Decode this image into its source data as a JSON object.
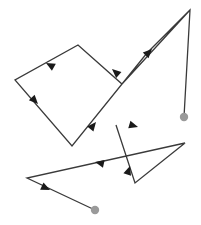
{
  "figure": {
    "type": "directed-polyline-diagram",
    "width": 201,
    "height": 225,
    "background_color": "#ffffff",
    "line_color": "#3a3a3a",
    "line_width": 1.3,
    "arrow_color": "#1a1a1a",
    "endpoint_dot_color": "#9a9a9a",
    "endpoint_dot_radius": 4.2,
    "arrow_length": 9,
    "arrow_half_width": 4,
    "title": "",
    "paths": [
      {
        "name": "path-a",
        "description": "Long zigzag path starting at top-right apex, sweeping left through an upper quadrilateral loop and down to the lower-left gray endpoint dot",
        "points": [
          [
            190,
            10
          ],
          [
            122,
            84
          ],
          [
            78,
            45
          ],
          [
            15,
            80
          ],
          [
            72,
            146
          ],
          [
            147,
            53
          ],
          [
            190,
            10
          ],
          [
            184,
            117
          ]
        ],
        "arrows": [
          {
            "at": [
              152,
              49
            ],
            "angle": -45
          },
          {
            "at": [
              112,
              69
            ],
            "angle": 221
          },
          {
            "at": [
              46,
              63
            ],
            "angle": 209
          },
          {
            "at": [
              38,
              104
            ],
            "angle": 46
          },
          {
            "at": [
              96,
              122
            ],
            "angle": -51
          }
        ],
        "start_dot": false,
        "end_dot": true,
        "end_dot_at": [
          184,
          117
        ]
      },
      {
        "name": "path-b",
        "description": "Lower zigzag path forming a narrow triangle on the right, crossing left to a shallow V and ending at the bottom gray dot",
        "points": [
          [
            116,
            125
          ],
          [
            135,
            183
          ],
          [
            185,
            143
          ],
          [
            27,
            178
          ],
          [
            95,
            210
          ]
        ],
        "arrows": [
          {
            "at": [
              138,
              127
            ],
            "angle": 16
          },
          {
            "at": [
              130,
              166
            ],
            "angle": 288
          },
          {
            "at": [
              95,
              162
            ],
            "angle": 192
          },
          {
            "at": [
              50,
              190
            ],
            "angle": 25
          }
        ],
        "start_dot": false,
        "end_dot": true,
        "end_dot_at": [
          95,
          210
        ]
      }
    ],
    "endpoint_dots": [
      {
        "name": "endpoint-dot-right",
        "at": [
          184,
          117
        ]
      },
      {
        "name": "endpoint-dot-bottom",
        "at": [
          95,
          210
        ]
      }
    ]
  }
}
